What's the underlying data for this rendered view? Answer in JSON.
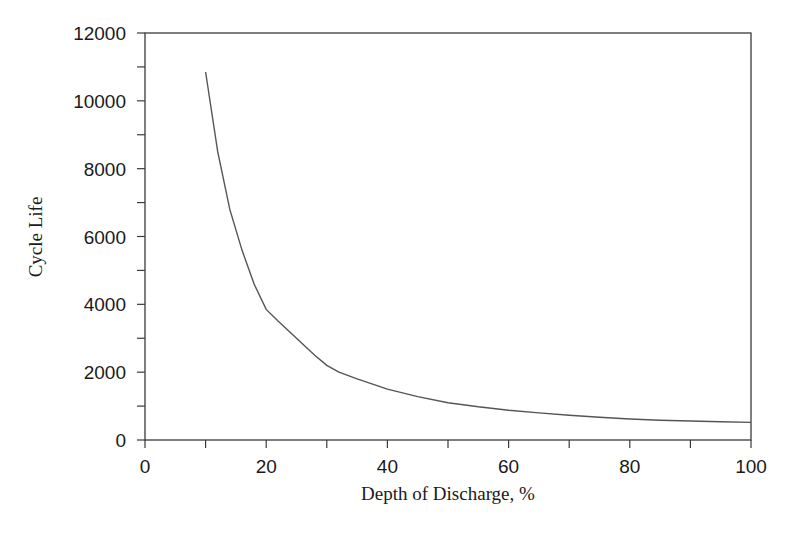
{
  "chart_data": {
    "type": "line",
    "title": "",
    "xlabel": "Depth of Discharge, %",
    "ylabel": "Cycle Life",
    "xlim": [
      0,
      100
    ],
    "ylim": [
      0,
      12000
    ],
    "x_ticks": [
      0,
      20,
      40,
      60,
      80,
      100
    ],
    "x_minor_ticks": [
      10,
      30,
      50,
      70,
      90
    ],
    "y_ticks": [
      0,
      2000,
      4000,
      6000,
      8000,
      10000,
      12000
    ],
    "y_minor_ticks": [
      1000,
      3000,
      5000,
      7000,
      9000,
      11000
    ],
    "grid": false,
    "legend": null,
    "series": [
      {
        "name": "Cycle Life",
        "color": "#555555",
        "x": [
          10,
          12,
          14,
          16,
          18,
          20,
          22,
          25,
          28,
          30,
          32,
          35,
          40,
          45,
          50,
          55,
          60,
          65,
          70,
          75,
          80,
          85,
          90,
          95,
          100
        ],
        "y": [
          10850,
          8500,
          6800,
          5600,
          4600,
          3850,
          3500,
          3000,
          2500,
          2200,
          2000,
          1800,
          1500,
          1280,
          1100,
          980,
          880,
          800,
          730,
          670,
          620,
          580,
          560,
          540,
          520
        ]
      }
    ]
  }
}
